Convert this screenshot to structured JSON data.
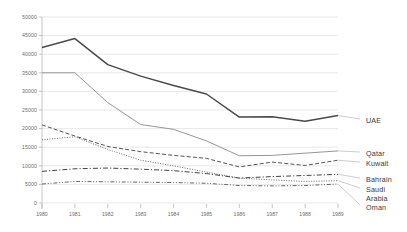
{
  "chart_data": {
    "type": "line",
    "title": "",
    "subtitle": "",
    "xlabel": "",
    "ylabel": "",
    "x": [
      1980,
      1981,
      1982,
      1983,
      1984,
      1985,
      1986,
      1987,
      1988,
      1989
    ],
    "xtick_labels": [
      "1980",
      "1981",
      "1982",
      "1983",
      "1984",
      "1985",
      "1986",
      "1987",
      "1988",
      "1989"
    ],
    "ytick_labels": [
      "0",
      "5000",
      "10000",
      "15000",
      "20000",
      "25000",
      "30000",
      "35000",
      "40000",
      "45000",
      "50000"
    ],
    "ytick_values": [
      0,
      5000,
      10000,
      15000,
      20000,
      25000,
      30000,
      35000,
      40000,
      45000,
      50000
    ],
    "ylim": [
      0,
      50000
    ],
    "xlim": [
      1980,
      1989
    ],
    "grid": "horizontal",
    "legend_position": "right-inline",
    "series": [
      {
        "name": "UAE",
        "style": "solid",
        "color": "#4a4a4a",
        "width": 1.5,
        "values": [
          41800,
          44200,
          37200,
          34100,
          31600,
          29300,
          23100,
          23200,
          22000,
          23500
        ]
      },
      {
        "name": "Qatar",
        "style": "solid-thin",
        "color": "#8a8a8a",
        "width": 0.9,
        "values": [
          35000,
          35000,
          27000,
          21100,
          19800,
          16700,
          12700,
          12800,
          13400,
          14000
        ]
      },
      {
        "name": "Kuwait",
        "style": "dashed",
        "color": "#555555",
        "width": 1.0,
        "values": [
          21000,
          18000,
          15200,
          13800,
          12800,
          12000,
          9700,
          11000,
          10100,
          11500
        ]
      },
      {
        "name": "Bahrain",
        "style": "dotted",
        "color": "#777777",
        "width": 1.0,
        "values": [
          17000,
          17800,
          14400,
          11500,
          10000,
          8300,
          6700,
          6200,
          5800,
          6000
        ]
      },
      {
        "name": "Saudi Arabia",
        "style": "dash-dot",
        "color": "#444444",
        "width": 1.0,
        "values": [
          8500,
          9200,
          9400,
          9100,
          8700,
          7900,
          6700,
          7100,
          7400,
          7700
        ]
      },
      {
        "name": "Oman",
        "style": "dash-dot-dot",
        "color": "#666666",
        "width": 1.0,
        "values": [
          5100,
          5800,
          5700,
          5600,
          5500,
          5300,
          4700,
          4600,
          4700,
          5100
        ]
      }
    ],
    "series_labels": [
      {
        "text": "UAE",
        "y_value": 23500
      },
      {
        "text": "Qatar",
        "y_value": 14000
      },
      {
        "text": "Kuwait",
        "y_value": 11500
      },
      {
        "text": "Bahrain",
        "y_value": 7700
      },
      {
        "text": "Saudi",
        "y_value": 6000
      },
      {
        "text": "Arabia",
        "y_value": 4500
      },
      {
        "text": "Oman",
        "y_value": 3000
      }
    ],
    "colors": {
      "gridline": "#d9d9d9",
      "axis": "#b0b0b0",
      "tick_text": "#6e6e6e",
      "label_text": "#3a3a3a",
      "background": "#ffffff"
    }
  }
}
